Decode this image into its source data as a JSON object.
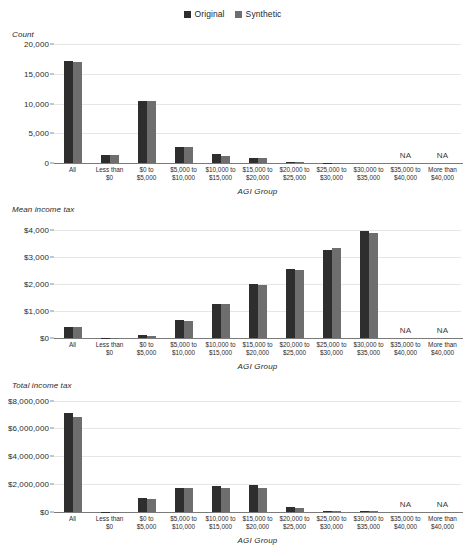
{
  "legend": {
    "entries": [
      {
        "label": "Original",
        "color": "#2e2e2e",
        "icon": "square-swatch-icon"
      },
      {
        "label": "Synthetic",
        "color": "#6e6e6e",
        "icon": "square-swatch-icon"
      }
    ]
  },
  "colors": {
    "original": "#2e2e2e",
    "synthetic": "#6e6e6e",
    "gridline": "#e6e6e6",
    "axis": "#7a7a7a",
    "text": "#2b2b2b",
    "background": "#ffffff"
  },
  "categories": [
    "All",
    "Less than\n$0",
    "$0 to\n$5,000",
    "$5,000 to\n$10,000",
    "$10,000 to\n$15,000",
    "$15,000 to\n$20,000",
    "$20,000 to\n$25,000",
    "$25,000 to\n$30,000",
    "$30,000 to\n$35,000",
    "$35,000 to\n$40,000",
    "More than\n$40,000"
  ],
  "na_label": "NA",
  "xaxis_title": "AGI Group",
  "chart_data": [
    {
      "type": "bar",
      "title": "",
      "ylabel": "Count",
      "xlabel": "AGI Group",
      "grid": true,
      "legend_position": "top-center",
      "ylim": [
        0,
        20000
      ],
      "yticks": [
        0,
        5000,
        10000,
        15000,
        20000
      ],
      "ytick_labels": [
        "0",
        "5,000",
        "10,000",
        "15,000",
        "20,000"
      ],
      "categories": [
        "All",
        "Less than $0",
        "$0 to $5,000",
        "$5,000 to $10,000",
        "$10,000 to $15,000",
        "$15,000 to $20,000",
        "$20,000 to $25,000",
        "$25,000 to $30,000",
        "$30,000 to $35,000",
        "$35,000 to $40,000",
        "More than $40,000"
      ],
      "series": [
        {
          "name": "Original",
          "values": [
            17100,
            1350,
            10350,
            2680,
            1480,
            880,
            130,
            30,
            10,
            null,
            null
          ]
        },
        {
          "name": "Synthetic",
          "values": [
            16950,
            1300,
            10400,
            2620,
            1250,
            760,
            110,
            25,
            10,
            null,
            null
          ]
        }
      ],
      "na_categories": [
        "$35,000 to $40,000",
        "More than $40,000"
      ]
    },
    {
      "type": "bar",
      "title": "",
      "ylabel": "Mean income tax",
      "xlabel": "AGI Group",
      "grid": true,
      "legend_position": "top-center",
      "ylim": [
        0,
        4400
      ],
      "yticks": [
        0,
        1000,
        2000,
        3000,
        4000
      ],
      "ytick_labels": [
        "$0",
        "$1,000",
        "$2,000",
        "$3,000",
        "$4,000"
      ],
      "categories": [
        "All",
        "Less than $0",
        "$0 to $5,000",
        "$5,000 to $10,000",
        "$10,000 to $15,000",
        "$15,000 to $20,000",
        "$20,000 to $25,000",
        "$25,000 to $30,000",
        "$30,000 to $35,000",
        "$35,000 to $40,000",
        "More than $40,000"
      ],
      "series": [
        {
          "name": "Original",
          "values": [
            420,
            10,
            95,
            650,
            1250,
            1990,
            2560,
            3270,
            3960,
            null,
            null
          ]
        },
        {
          "name": "Synthetic",
          "values": [
            420,
            8,
            90,
            640,
            1260,
            1960,
            2530,
            3340,
            3880,
            null,
            null
          ]
        }
      ],
      "na_categories": [
        "$35,000 to $40,000",
        "More than $40,000"
      ]
    },
    {
      "type": "bar",
      "title": "",
      "ylabel": "Total income tax",
      "xlabel": "AGI Group",
      "grid": true,
      "legend_position": "top-center",
      "ylim": [
        0,
        8400000
      ],
      "yticks": [
        0,
        2000000,
        4000000,
        6000000,
        8000000
      ],
      "ytick_labels": [
        "$0",
        "$2,000,000",
        "$4,000,000",
        "$6,000,000",
        "$8,000,000"
      ],
      "categories": [
        "All",
        "Less than $0",
        "$0 to $5,000",
        "$5,000 to $10,000",
        "$10,000 to $15,000",
        "$15,000 to $20,000",
        "$20,000 to $25,000",
        "$25,000 to $30,000",
        "$30,000 to $35,000",
        "$35,000 to $40,000",
        "More than $40,000"
      ],
      "series": [
        {
          "name": "Original",
          "values": [
            7100000,
            15000,
            985000,
            1750000,
            1860000,
            1950000,
            330000,
            98000,
            40000,
            null,
            null
          ]
        },
        {
          "name": "Synthetic",
          "values": [
            6800000,
            12000,
            930000,
            1710000,
            1750000,
            1760000,
            280000,
            84000,
            39000,
            null,
            null
          ]
        }
      ],
      "na_categories": [
        "$35,000 to $40,000",
        "More than $40,000"
      ]
    }
  ]
}
